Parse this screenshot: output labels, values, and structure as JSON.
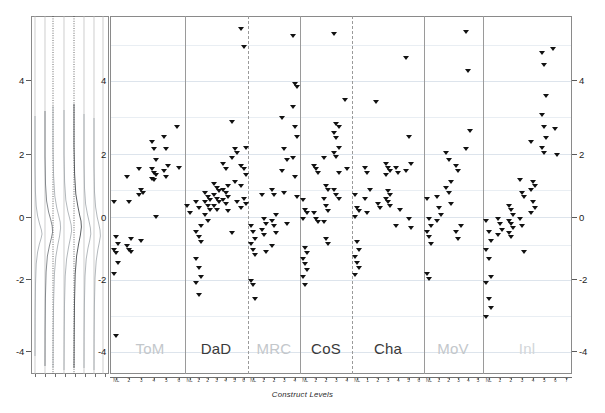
{
  "figure": {
    "type": "wright-map-item-person",
    "axis_title_x": "Construct Levels",
    "y_axis_label": "",
    "y_ticks": [
      "4",
      "2",
      "0",
      "-2",
      "-4"
    ],
    "y_ticks_right": [
      "4",
      "2",
      "0",
      "-2",
      "-4"
    ]
  },
  "colors": {
    "marker": "#111111",
    "frame": "#8a8a8a",
    "grid": "#e9eef3",
    "facet_dark": "#3a3a3a",
    "facet_light": "#c3c7cb",
    "separator": "#9a9a9a",
    "density_curve": "#9aa0a6",
    "density_curve_dark": "#4a4a4a"
  },
  "chart_data": {
    "type": "scatter",
    "title": "",
    "subtitle": "",
    "xlabel": "Construct Levels",
    "ylabel": "",
    "ylim": [
      -4.6,
      5.2
    ],
    "yticks": [
      -4,
      -2,
      0,
      2,
      4
    ],
    "grid": true,
    "legend": "none",
    "marker": "triangle-down",
    "panels": [
      {
        "label": "ToM",
        "emphasis": "light",
        "levels": [
          "NL",
          "2",
          "3",
          "4",
          "5",
          "6"
        ],
        "points": [
          {
            "level": 1,
            "values": [
              0.1,
              -0.85,
              -1.05,
              -1.2,
              -1.3,
              -1.55,
              -1.85,
              -3.55
            ]
          },
          {
            "level": 2,
            "values": [
              0.8,
              0.1,
              -0.9,
              -1.1,
              -1.2,
              -1.25
            ]
          },
          {
            "level": 3,
            "values": [
              1.0,
              0.45,
              0.35,
              0.3,
              -0.95
            ]
          },
          {
            "level": 4,
            "values": [
              1.75,
              1.55,
              1.25,
              1.0,
              0.9,
              0.85,
              0.75,
              0.7,
              -0.3
            ]
          },
          {
            "level": 5,
            "values": [
              1.9,
              1.55,
              1.1,
              0.95,
              0.8
            ]
          },
          {
            "level": 6,
            "values": [
              2.15,
              1.05
            ]
          }
        ]
      },
      {
        "label": "DaD",
        "emphasis": "dark",
        "levels": [
          "NL",
          "1",
          "2",
          "3",
          "4",
          "5",
          "6"
        ],
        "points": [
          {
            "level": 1,
            "values": [
              0.0,
              -0.2
            ]
          },
          {
            "level": 2,
            "values": [
              0.1,
              -0.05,
              -0.55,
              -0.7,
              -0.85,
              -1.0,
              -1.45,
              -1.7,
              -1.95,
              -2.1,
              -2.45
            ]
          },
          {
            "level": 3,
            "values": [
              0.35,
              0.25,
              0.15,
              0.1,
              0.0,
              -0.1,
              -0.25,
              -0.4
            ]
          },
          {
            "level": 4,
            "values": [
              0.6,
              0.5,
              0.4,
              0.3,
              0.2,
              0.1,
              0.0,
              -0.1
            ]
          },
          {
            "level": 5,
            "values": [
              1.15,
              1.0,
              0.55,
              0.45,
              0.35,
              0.25,
              0.15,
              0.05,
              -0.15
            ]
          },
          {
            "level": 6,
            "values": [
              2.3,
              1.55,
              1.45,
              1.3,
              0.65,
              0.1,
              -0.75
            ]
          },
          {
            "level": 7,
            "values": [
              4.85,
              4.35,
              1.6,
              1.1,
              1.0,
              0.85,
              0.55,
              0.2,
              0.05,
              -0.05
            ]
          }
        ]
      },
      {
        "label": "MRC",
        "emphasis": "light",
        "levels": [
          "NL",
          "1",
          "2",
          "3",
          "4"
        ],
        "points": [
          {
            "level": 1,
            "values": [
              -0.55,
              -0.7,
              -0.9,
              -1.05,
              -1.2,
              -1.35,
              -2.05,
              -2.15,
              -2.55
            ]
          },
          {
            "level": 2,
            "values": [
              0.3,
              -0.35,
              -0.5,
              -0.65,
              -0.8,
              -1.25
            ]
          },
          {
            "level": 3,
            "values": [
              0.45,
              0.3,
              -0.25,
              -0.4,
              -0.55,
              -0.75,
              -1.1
            ]
          },
          {
            "level": 4,
            "values": [
              2.4,
              1.55,
              1.25,
              0.95,
              0.35,
              -0.5
            ]
          },
          {
            "level": 5,
            "values": [
              4.65,
              3.35,
              3.25,
              2.7,
              2.15,
              1.9,
              1.3,
              0.8,
              0.25
            ]
          }
        ]
      },
      {
        "label": "CoS",
        "emphasis": "dark",
        "levels": [
          "NL",
          "1",
          "2",
          "3",
          "4"
        ],
        "points": [
          {
            "level": 1,
            "values": [
              0.15,
              -0.1,
              -0.2,
              -0.35,
              -1.15,
              -1.3,
              -1.45,
              -1.6,
              -1.75,
              -1.95,
              -2.15
            ]
          },
          {
            "level": 2,
            "values": [
              1.1,
              1.0,
              0.9,
              -0.2,
              -0.35,
              -0.45
            ]
          },
          {
            "level": 3,
            "values": [
              1.3,
              0.55,
              0.45,
              0.2,
              0.0,
              -0.15,
              -0.45,
              -0.9,
              -1.05
            ]
          },
          {
            "level": 4,
            "values": [
              4.7,
              2.25,
              2.15,
              2.0,
              1.85,
              1.6,
              1.45,
              1.35,
              0.9,
              0.45,
              0.3,
              0.2
            ]
          },
          {
            "level": 5,
            "values": [
              2.9,
              1.0
            ]
          }
        ]
      },
      {
        "label": "Cha",
        "emphasis": "dark",
        "levels": [
          "NL",
          "1",
          "2",
          "3",
          "4",
          "5",
          "6"
        ],
        "points": [
          {
            "level": 1,
            "values": [
              0.3,
              -0.05,
              -0.15,
              -0.3,
              -1.0,
              -1.2,
              -1.4,
              -1.55,
              -1.7,
              -1.9
            ]
          },
          {
            "level": 2,
            "values": [
              1.05,
              0.9,
              0.45,
              0.2,
              -0.2
            ]
          },
          {
            "level": 3,
            "values": [
              2.85,
              0.05,
              -0.05
            ]
          },
          {
            "level": 4,
            "values": [
              1.15,
              1.05,
              0.95,
              0.85,
              0.4,
              0.3,
              0.2,
              0.1,
              0.0
            ]
          },
          {
            "level": 5,
            "values": [
              1.05,
              0.9,
              -0.1,
              -0.55
            ]
          },
          {
            "level": 6,
            "values": [
              4.05,
              1.9,
              1.15,
              0.95,
              -0.35,
              -0.6
            ]
          }
        ]
      },
      {
        "label": "MoV",
        "emphasis": "light",
        "levels": [
          "NL",
          "1",
          "2",
          "3",
          "4",
          "5"
        ],
        "points": [
          {
            "level": 1,
            "values": [
              0.2,
              -0.35,
              -0.55,
              -0.7,
              -0.85,
              -1.05,
              -1.85,
              -2.0
            ]
          },
          {
            "level": 2,
            "values": [
              0.25,
              -0.05,
              -0.25,
              -0.4
            ]
          },
          {
            "level": 3,
            "values": [
              1.45,
              1.25,
              0.65,
              0.5,
              0.35,
              0.05
            ]
          },
          {
            "level": 4,
            "values": [
              1.1,
              0.95,
              -0.55,
              -0.7,
              -0.9
            ]
          },
          {
            "level": 5,
            "values": [
              4.75,
              3.7,
              2.05,
              1.55
            ]
          }
        ]
      },
      {
        "label": "Inl",
        "emphasis": "light",
        "levels": [
          "NL",
          "1",
          "2",
          "3",
          "4",
          "5",
          "6",
          "7"
        ],
        "points": [
          {
            "level": 1,
            "values": [
              -0.4,
              -0.7,
              -0.95,
              -1.2,
              -1.45,
              -1.95,
              -2.1,
              -2.55,
              -2.8,
              -3.05
            ]
          },
          {
            "level": 2,
            "values": [
              -0.35,
              -0.5,
              -0.65,
              -0.8
            ]
          },
          {
            "level": 3,
            "values": [
              0.0,
              -0.1,
              -0.25,
              -0.4,
              -0.5,
              -0.6,
              -0.75,
              -0.85
            ]
          },
          {
            "level": 4,
            "values": [
              0.7,
              0.35,
              0.25,
              -0.35,
              -0.55,
              -1.25
            ]
          },
          {
            "level": 5,
            "values": [
              1.75,
              0.65,
              0.55,
              0.45,
              0.1,
              -0.05,
              -0.2
            ]
          },
          {
            "level": 6,
            "values": [
              4.2,
              3.85,
              3.0,
              2.5,
              2.15,
              1.85,
              1.6,
              1.45
            ]
          },
          {
            "level": 7,
            "values": [
              4.3,
              2.1,
              1.4
            ]
          }
        ]
      }
    ],
    "density": {
      "description": "Person ability kernel density curves, one per construct",
      "curves": 7,
      "reference_lines": 7
    }
  }
}
